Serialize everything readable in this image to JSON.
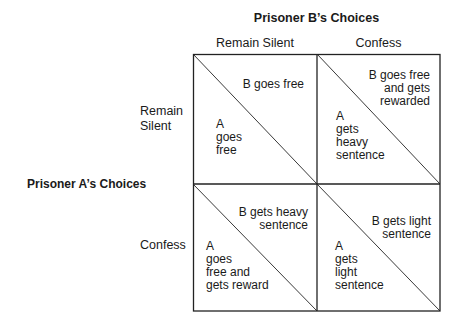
{
  "diagram": {
    "title_b": "Prisoner B’s Choices",
    "title_a": "Prisoner  A’s Choices",
    "columns": [
      "Remain Silent",
      "Confess"
    ],
    "rows": [
      "Remain\nSilent",
      "Confess"
    ],
    "cells": [
      {
        "row": "Remain Silent",
        "col": "Remain Silent",
        "b": "B goes free",
        "a": "A\ngoes\nfree"
      },
      {
        "row": "Remain Silent",
        "col": "Confess",
        "b": "B goes free\nand gets\nrewarded",
        "a": "A\ngets\nheavy\nsentence"
      },
      {
        "row": "Confess",
        "col": "Remain Silent",
        "b": "B gets heavy\nsentence",
        "a": "A\ngoes\nfree and\ngets reward"
      },
      {
        "row": "Confess",
        "col": "Confess",
        "b": "B gets light\nsentence",
        "a": "A\ngets\nlight\nsentence"
      }
    ]
  }
}
